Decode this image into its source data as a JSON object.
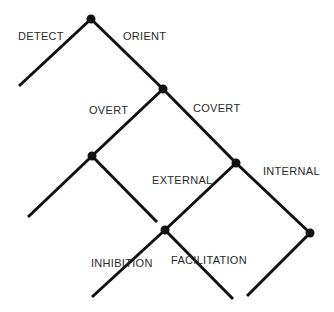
{
  "diagram": {
    "type": "binary-decision-tree",
    "colors": {
      "line": "#111111",
      "node": "#111111",
      "text": "#2a2a2a",
      "background": "#ffffff"
    },
    "nodes": [
      {
        "id": "root",
        "x": 91,
        "y": 19
      },
      {
        "id": "orient",
        "x": 163,
        "y": 89
      },
      {
        "id": "overt",
        "x": 92,
        "y": 156
      },
      {
        "id": "covert",
        "x": 236,
        "y": 163
      },
      {
        "id": "external",
        "x": 165,
        "y": 230
      },
      {
        "id": "internal",
        "x": 310,
        "y": 233
      }
    ],
    "edges": [
      {
        "from": "root",
        "to_leaf": [
          19,
          86
        ],
        "label": "DETECT"
      },
      {
        "from": "root",
        "to": "orient",
        "label": "ORIENT"
      },
      {
        "from": "orient",
        "to": "overt",
        "label": "OVERT"
      },
      {
        "from": "orient",
        "to": "covert",
        "label": "COVERT"
      },
      {
        "from": "overt",
        "to_leaf": [
          28,
          217
        ]
      },
      {
        "from": "overt",
        "to_leaf": [
          157,
          222
        ]
      },
      {
        "from": "covert",
        "to": "external",
        "label": "EXTERNAL"
      },
      {
        "from": "covert",
        "to": "internal",
        "label": "INTERNAL"
      },
      {
        "from": "external",
        "to_leaf": [
          92,
          297
        ],
        "label": "INHIBITION"
      },
      {
        "from": "external",
        "to_leaf": [
          233,
          299
        ],
        "label": "FACILITATION"
      },
      {
        "from": "internal",
        "to_leaf": [
          247,
          296
        ]
      }
    ],
    "labels": {
      "detect": "DETECT",
      "orient": "ORIENT",
      "overt": "OVERT",
      "covert": "COVERT",
      "external": "EXTERNAL",
      "internal": "INTERNAL",
      "inhibition": "INHIBITION",
      "facilitation": "FACILITATION"
    }
  }
}
